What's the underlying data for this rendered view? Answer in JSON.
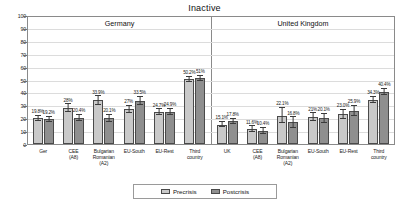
{
  "chart_data": {
    "type": "bar",
    "title": "Inactive",
    "xlabel": "",
    "ylabel": "",
    "ylim": [
      0,
      100
    ],
    "yticks": [
      0,
      10,
      20,
      30,
      40,
      50,
      60,
      70,
      80,
      90,
      100
    ],
    "grid": true,
    "legend_position": "bottom",
    "panels": [
      {
        "name": "Germany",
        "categories": [
          "Ger",
          "CEE\n(A8)",
          "Bulgarian\nRomanian\n(A2)",
          "EU-South",
          "EU-Rest",
          "Third\ncountry"
        ],
        "series": [
          {
            "name": "Precrisis",
            "values": [
              19.8,
              28.0,
              33.9,
              27.0,
              24.7,
              50.2
            ],
            "labels": [
              "19.8%",
              "28%",
              "33.9%",
              "27%",
              "24.7%",
              "50.2%"
            ]
          },
          {
            "name": "Postcrisis",
            "values": [
              19.2,
              20.4,
              20.1,
              33.5,
              24.9,
              51.0
            ],
            "labels": [
              "19.2%",
              "20.4%",
              "20.1%",
              "33.5%",
              "24.9%",
              "51%"
            ]
          }
        ]
      },
      {
        "name": "United Kingdom",
        "categories": [
          "UK",
          "CEE\n(A8)",
          "Bulgarian\nRomanian\n(A2)",
          "EU-South",
          "EU-Rest",
          "Third\ncountry"
        ],
        "series": [
          {
            "name": "Precrisis",
            "values": [
              15.1,
              11.6,
              22.1,
              21.0,
              23.0,
              34.3
            ],
            "labels": [
              "15.1%",
              "11.6%",
              "22.1%",
              "21%",
              "23.0%",
              "34.3%"
            ]
          },
          {
            "name": "Postcrisis",
            "values": [
              17.8,
              10.4,
              16.8,
              20.1,
              25.9,
              40.4
            ],
            "labels": [
              "17.8%",
              "10.4%",
              "16.8%",
              "20.1%",
              "25.9%",
              "40.4%"
            ]
          }
        ]
      }
    ],
    "legend": [
      {
        "label": "Precrisis",
        "color": "#c9c9c9"
      },
      {
        "label": "Postcrisis",
        "color": "#8f8f8f"
      }
    ],
    "error_bars": {
      "Germany": {
        "Precrisis": [
          2.0,
          3.0,
          3.2,
          2.6,
          2.4,
          2.0
        ],
        "Postcrisis": [
          2.0,
          2.4,
          2.6,
          3.0,
          2.4,
          2.0
        ]
      },
      "United Kingdom": {
        "Precrisis": [
          2.0,
          2.2,
          6.0,
          3.0,
          3.4,
          2.4
        ],
        "Postcrisis": [
          2.0,
          2.2,
          4.0,
          3.4,
          4.0,
          2.6
        ]
      }
    }
  }
}
